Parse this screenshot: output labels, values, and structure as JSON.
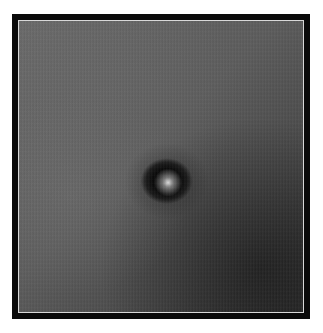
{
  "image": {
    "subject": "dark circular spot with bright center on grainy gray field",
    "frame_color": "#0a0a0a",
    "inner_border_color": "#d8d8d8",
    "background_color": "#ffffff",
    "field_tone_light": "#6a6a6a",
    "field_tone_dark": "#333333",
    "spot_color": "#050505",
    "spot_center_highlight": "#ebebeb"
  }
}
